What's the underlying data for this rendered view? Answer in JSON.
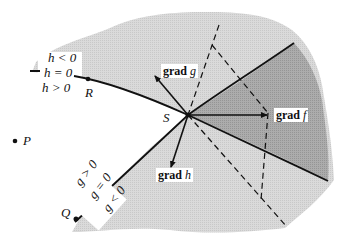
{
  "diagram": {
    "points": {
      "S": "S",
      "R": "R",
      "P": "P",
      "Q": "Q"
    },
    "gradients": {
      "grad_f": {
        "prefix": "grad",
        "var": "f"
      },
      "grad_g": {
        "prefix": "grad",
        "var": "g"
      },
      "grad_h": {
        "prefix": "grad",
        "var": "h"
      }
    },
    "h_labels": [
      "h < 0",
      "h = 0",
      "h > 0"
    ],
    "g_labels": [
      "g > 0",
      "g = 0",
      "g < 0"
    ],
    "colors": {
      "background": "#ffffff",
      "light_region": "#d9d9d9",
      "dark_region": "#a8a8a8",
      "lines": "#111111"
    }
  }
}
